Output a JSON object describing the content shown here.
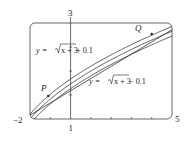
{
  "chart_data": {
    "type": "line",
    "title": "",
    "xlabel": "",
    "ylabel": "",
    "xlim": [
      -2,
      5
    ],
    "ylim": [
      1,
      3
    ],
    "grid": false,
    "tick_labels": {
      "x_left": "−2",
      "x_right": "5",
      "y_top": "3",
      "y_bottom": "1"
    },
    "series": [
      {
        "name": "y = √(x+3) + 0.1",
        "expr": "sqrt(x+3)+0.1",
        "x": [
          -2,
          -1,
          0,
          1,
          2,
          3,
          4,
          5
        ],
        "values": [
          1.1,
          1.514,
          1.832,
          2.1,
          2.336,
          2.549,
          2.746,
          2.928
        ]
      },
      {
        "name": "y = √(x+3)",
        "expr": "sqrt(x+3)",
        "x": [
          -2,
          -1,
          0,
          1,
          2,
          3,
          4,
          5
        ],
        "values": [
          1.0,
          1.414,
          1.732,
          2.0,
          2.236,
          2.449,
          2.646,
          2.828
        ]
      },
      {
        "name": "y = √(x+3) − 0.1",
        "expr": "sqrt(x+3)-0.1",
        "x": [
          -2,
          -1,
          0,
          1,
          2,
          3,
          4,
          5
        ],
        "values": [
          0.9,
          1.314,
          1.632,
          1.9,
          2.136,
          2.349,
          2.546,
          2.728
        ]
      },
      {
        "name": "secant PQ",
        "expr": "line",
        "x": [
          -2,
          5
        ],
        "values": [
          1.08,
          2.86
        ]
      }
    ],
    "points": [
      {
        "label": "P",
        "x": -1.1,
        "y": 1.48
      },
      {
        "label": "Q",
        "x": 4.0,
        "y": 2.77
      }
    ],
    "annotations": [
      {
        "text_prefix": "y = ",
        "radicand": "x + 3",
        "suffix": " + 0.1"
      },
      {
        "text_prefix": "y = ",
        "radicand": "x + 3",
        "suffix": " − 0.1"
      }
    ]
  },
  "labels": {
    "upper_prefix": "y = ",
    "upper_radicand": "x + 3",
    "upper_suffix": " + 0.1",
    "lower_prefix": "y = ",
    "lower_radicand": "x + 3",
    "lower_suffix": " − 0.1",
    "point_p": "P",
    "point_q": "Q",
    "x_min": "−2",
    "x_max": "5",
    "y_max": "3",
    "y_min": "1"
  },
  "colors": {
    "curve": "#333333",
    "frame": "#444444",
    "text": "#222222"
  }
}
